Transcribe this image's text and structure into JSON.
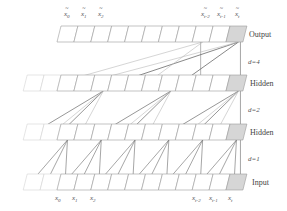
{
  "diagram": {
    "layers": [
      {
        "name": "output",
        "label": "Output",
        "y": 26,
        "x0": 57,
        "cells": 11,
        "faint_cells": 0
      },
      {
        "name": "hidden-2",
        "label": "Hidden",
        "y": 75,
        "x0": 57,
        "cells": 11,
        "faint_cells": 2
      },
      {
        "name": "hidden-1",
        "label": "Hidden",
        "y": 124,
        "x0": 57,
        "cells": 11,
        "faint_cells": 2
      },
      {
        "name": "input",
        "label": "Input",
        "y": 174,
        "x0": 57,
        "cells": 11,
        "faint_cells": 2
      }
    ],
    "dilations": [
      {
        "label": "d=4",
        "y": 62
      },
      {
        "label": "d=2",
        "y": 110
      },
      {
        "label": "d=1",
        "y": 160
      }
    ],
    "output_tokens": [
      {
        "base": "x",
        "sub": "0",
        "accent": "~"
      },
      {
        "base": "x",
        "sub": "1",
        "accent": "~"
      },
      {
        "base": "x",
        "sub": "2",
        "accent": "~"
      },
      {
        "base": "x",
        "sub": "t-2",
        "accent": "~"
      },
      {
        "base": "x",
        "sub": "t-1",
        "accent": "~"
      },
      {
        "base": "x",
        "sub": "t",
        "accent": "~"
      }
    ],
    "input_tokens": [
      {
        "base": "x",
        "sub": "0"
      },
      {
        "base": "x",
        "sub": "1"
      },
      {
        "base": "x",
        "sub": "2"
      },
      {
        "base": "x",
        "sub": "t-2"
      },
      {
        "base": "x",
        "sub": "t-1"
      },
      {
        "base": "x",
        "sub": "t"
      }
    ],
    "colors": {
      "cell_border": "#9a9a9a",
      "faint_border": "#d4d4d4",
      "current_cell_fill": "#d6d6d6",
      "edge_dark": "#6a6a6a",
      "edge_light": "#b8b8b8"
    }
  }
}
